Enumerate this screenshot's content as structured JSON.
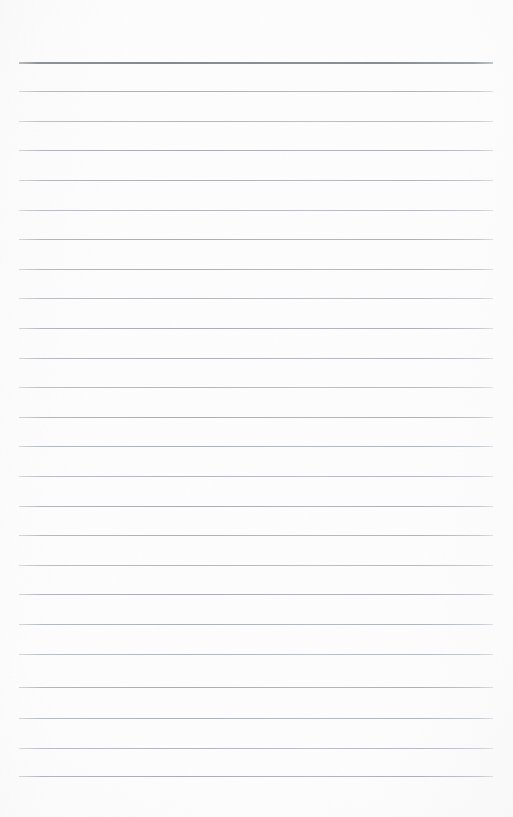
{
  "document": {
    "kind": "ruled-notebook-page",
    "title": "Blank ruled notepad page",
    "width_px": 513,
    "height_px": 817,
    "background_color": "#fdfdfd",
    "content_text": "",
    "has_text_content": false
  },
  "ruling": {
    "line_count": 25,
    "first_line_y": 62,
    "line_spacing_px": 29.7,
    "line_left_x": 19,
    "line_right_x": 493,
    "line_width_px": 474,
    "header_rule_color": "#8e9296",
    "header_rule_thickness_px": 2,
    "body_rule_color": "#b6babe",
    "body_rule_thickness_px": 1,
    "lines": [
      {
        "index": 1,
        "y": 62,
        "style": "header",
        "opacity": 1
      },
      {
        "index": 2,
        "y": 91,
        "style": "body",
        "opacity": 0.95
      },
      {
        "index": 3,
        "y": 121,
        "style": "body",
        "opacity": 0.88
      },
      {
        "index": 4,
        "y": 150,
        "style": "body",
        "opacity": 1
      },
      {
        "index": 5,
        "y": 180,
        "style": "body",
        "opacity": 0.95
      },
      {
        "index": 6,
        "y": 210,
        "style": "body",
        "opacity": 0.88
      },
      {
        "index": 7,
        "y": 239,
        "style": "body",
        "opacity": 1
      },
      {
        "index": 8,
        "y": 269,
        "style": "body",
        "opacity": 0.95
      },
      {
        "index": 9,
        "y": 298,
        "style": "body",
        "opacity": 0.88
      },
      {
        "index": 10,
        "y": 328,
        "style": "body",
        "opacity": 1
      },
      {
        "index": 11,
        "y": 358,
        "style": "body",
        "opacity": 0.95
      },
      {
        "index": 12,
        "y": 387,
        "style": "body",
        "opacity": 0.88
      },
      {
        "index": 13,
        "y": 417,
        "style": "body",
        "opacity": 1
      },
      {
        "index": 14,
        "y": 446,
        "style": "body",
        "opacity": 0.95
      },
      {
        "index": 15,
        "y": 476,
        "style": "body",
        "opacity": 0.88
      },
      {
        "index": 16,
        "y": 506,
        "style": "body",
        "opacity": 1
      },
      {
        "index": 17,
        "y": 535,
        "style": "body",
        "opacity": 0.95
      },
      {
        "index": 18,
        "y": 565,
        "style": "body",
        "opacity": 0.88
      },
      {
        "index": 19,
        "y": 594,
        "style": "body",
        "opacity": 1
      },
      {
        "index": 20,
        "y": 624,
        "style": "body",
        "opacity": 0.95
      },
      {
        "index": 21,
        "y": 654,
        "style": "body",
        "opacity": 0.88
      },
      {
        "index": 22,
        "y": 687,
        "style": "body",
        "opacity": 1
      },
      {
        "index": 23,
        "y": 718,
        "style": "body",
        "opacity": 0.95
      },
      {
        "index": 24,
        "y": 748,
        "style": "body",
        "opacity": 0.88
      },
      {
        "index": 25,
        "y": 776,
        "style": "body",
        "opacity": 1
      }
    ]
  },
  "margins": {
    "top_blank_px": 62,
    "bottom_blank_px": 41,
    "left_px": 19,
    "right_px": 20
  }
}
